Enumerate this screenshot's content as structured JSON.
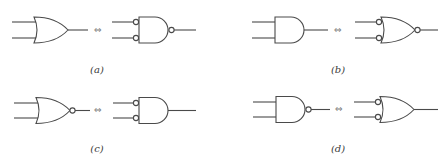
{
  "diagram": {
    "equivalence_symbol": "⇔",
    "panels": [
      {
        "id": "a",
        "label": "(a)",
        "left_gate": "OR",
        "right_gate": "NAND with inverted inputs"
      },
      {
        "id": "b",
        "label": "(b)",
        "left_gate": "AND",
        "right_gate": "NOR with inverted inputs"
      },
      {
        "id": "c",
        "label": "(c)",
        "left_gate": "NOR",
        "right_gate": "AND with inverted inputs"
      },
      {
        "id": "d",
        "label": "(d)",
        "left_gate": "NAND",
        "right_gate": "OR with inverted inputs"
      }
    ]
  }
}
